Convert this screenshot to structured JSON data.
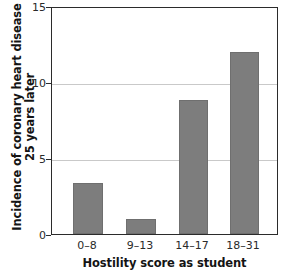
{
  "chart_data": {
    "type": "bar",
    "title": "",
    "subtitle": "",
    "xlabel": "Hostility score as student",
    "ylabel_lines": [
      "Incidence of coronary heart disease",
      "25 years later"
    ],
    "ylabel": "Incidence of coronary heart disease 25 years later",
    "categories": [
      "0–8",
      "9–13",
      "14–17",
      "18–31"
    ],
    "values": [
      3.4,
      1.0,
      8.9,
      12.1
    ],
    "ylim": [
      0,
      15
    ],
    "yticks": [
      0,
      5,
      10,
      15
    ],
    "ytick_labels": [
      "0",
      "5",
      "10",
      "15"
    ],
    "grid": "horizontal-at-5-and-10",
    "legend": "none",
    "bar_color": "#7d7d7d",
    "gridline_color": "#c9c9c9",
    "axis_color": "#2b2b2b",
    "background_color": "#ffffff"
  }
}
